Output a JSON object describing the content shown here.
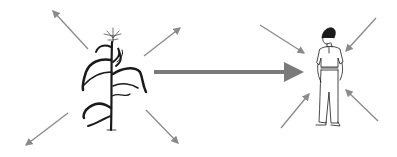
{
  "diagram": {
    "colors": {
      "background": "#ffffff",
      "arrow": "#8a8a8a",
      "main_arrow": "#7a7a7a",
      "ink": "#1a1a1a"
    },
    "nodes": [
      {
        "id": "corn-plant",
        "kind": "illustration",
        "arrows": "outward",
        "arrow_count": 4
      },
      {
        "id": "person",
        "kind": "illustration",
        "arrows": "inward",
        "arrow_count": 4
      }
    ],
    "edges": [
      {
        "from": "corn-plant",
        "to": "person",
        "style": "thick-arrow"
      }
    ]
  }
}
